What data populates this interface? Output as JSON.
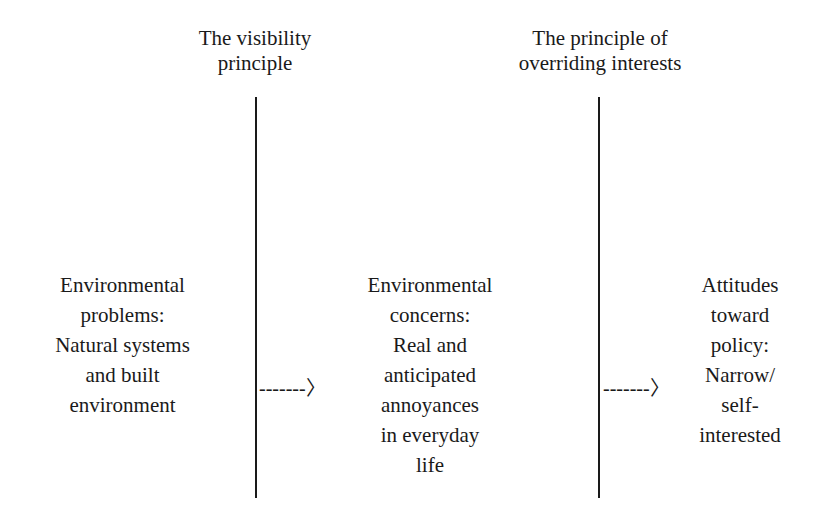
{
  "headers": {
    "visibility": [
      "The visibility",
      "principle"
    ],
    "overriding": [
      "The principle of",
      "overriding interests"
    ]
  },
  "boxes": {
    "problems": [
      "Environmental",
      "problems:",
      "Natural systems",
      "and built",
      "environment"
    ],
    "concerns": [
      "Environmental",
      "concerns:",
      "Real and",
      "anticipated",
      "annoyances",
      "in everyday",
      "life"
    ],
    "attitudes": [
      "Attitudes",
      "toward",
      "policy:",
      "Narrow/",
      "self-",
      "interested"
    ]
  },
  "arrows": {
    "first": "-------〉",
    "second": "-------〉"
  },
  "colors": {
    "ink": "#1a1a1a",
    "background": "#ffffff"
  }
}
